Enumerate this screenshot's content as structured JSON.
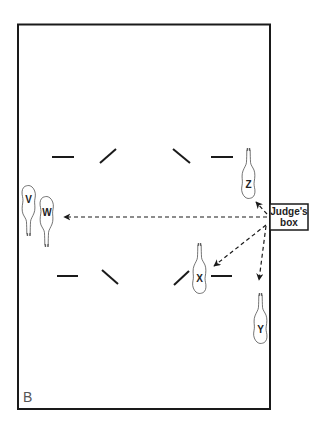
{
  "diagram": {
    "arena_label": "B",
    "judges_box": {
      "line1": "Judge's",
      "line2": "box"
    },
    "horses": [
      {
        "id": "V",
        "label": "V"
      },
      {
        "id": "W",
        "label": "W"
      },
      {
        "id": "X",
        "label": "X"
      },
      {
        "id": "Y",
        "label": "Y"
      },
      {
        "id": "Z",
        "label": "Z"
      }
    ],
    "colors": {
      "stroke": "#1a1a1a",
      "background": "#ffffff",
      "text": "#222222"
    }
  }
}
